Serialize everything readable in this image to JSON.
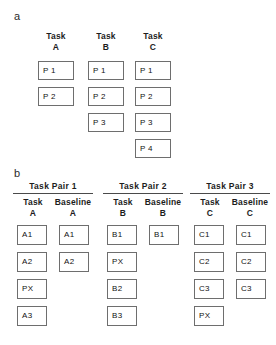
{
  "figure": {
    "panel_a": {
      "label": "a",
      "columns": [
        {
          "head_line1": "Task",
          "head_line2": "A",
          "boxes": [
            "P 1",
            "P 2"
          ]
        },
        {
          "head_line1": "Task",
          "head_line2": "B",
          "boxes": [
            "P 1",
            "P 2",
            "P 3"
          ]
        },
        {
          "head_line1": "Task",
          "head_line2": "C",
          "boxes": [
            "P 1",
            "P 2",
            "P 3",
            "P 4"
          ]
        }
      ]
    },
    "panel_b": {
      "label": "b",
      "groups": [
        {
          "title": "Task Pair 1",
          "task_col": {
            "head_line1": "Task",
            "head_line2": "A",
            "boxes": [
              "A1",
              "A2",
              "PX",
              "A3"
            ]
          },
          "baseline_col": {
            "head_line1": "Baseline",
            "head_line2": "A",
            "boxes": [
              "A1",
              "A2"
            ]
          }
        },
        {
          "title": "Task Pair 2",
          "task_col": {
            "head_line1": "Task",
            "head_line2": "B",
            "boxes": [
              "B1",
              "PX",
              "B2",
              "B3"
            ]
          },
          "baseline_col": {
            "head_line1": "Baseline",
            "head_line2": "B",
            "boxes": [
              "B1"
            ]
          }
        },
        {
          "title": "Task Pair 3",
          "task_col": {
            "head_line1": "Task",
            "head_line2": "C",
            "boxes": [
              "C1",
              "C2",
              "C3",
              "PX"
            ]
          },
          "baseline_col": {
            "head_line1": "Baseline",
            "head_line2": "C",
            "boxes": [
              "C1",
              "C2",
              "C3"
            ]
          }
        }
      ]
    },
    "colors": {
      "box_border": "#6e6e6e",
      "rule": "#4a4a4a",
      "text": "#1a1a1a",
      "background": "#ffffff"
    }
  }
}
